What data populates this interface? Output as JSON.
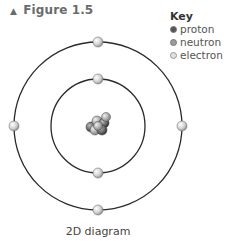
{
  "figure": {
    "marker": "▲",
    "title": "Figure 1.5",
    "caption": "2D diagram"
  },
  "key": {
    "title": "Key",
    "items": [
      {
        "label": "proton",
        "color": "#555555"
      },
      {
        "label": "neutron",
        "color": "#9a9a9a"
      },
      {
        "label": "electron",
        "color": "#d4d4d4"
      }
    ]
  },
  "atom": {
    "inner_shell_electrons": 2,
    "outer_shell_electrons": 4
  }
}
